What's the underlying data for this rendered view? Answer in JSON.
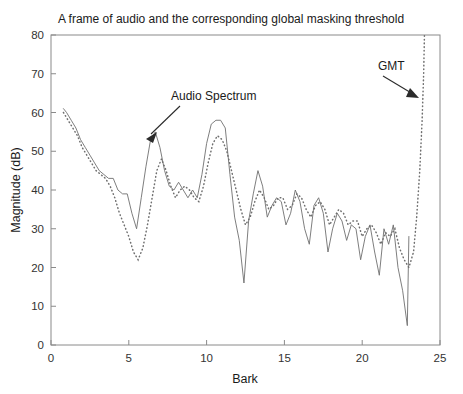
{
  "chart_data": {
    "type": "line",
    "title": "A frame of audio and the corresponding global masking threshold",
    "xlabel": "Bark",
    "ylabel": "Magnitude (dB)",
    "xlim": [
      0,
      25
    ],
    "ylim": [
      0,
      80
    ],
    "xticks": [
      0,
      5,
      10,
      15,
      20,
      25
    ],
    "yticks": [
      0,
      10,
      20,
      30,
      40,
      50,
      60,
      70,
      80
    ],
    "grid": false,
    "legend_position": "none",
    "annotations": [
      {
        "text": "Audio Spectrum",
        "target_series": "Audio Spectrum",
        "arrow_direction": "down-left"
      },
      {
        "text": "GMT",
        "target_series": "GMT",
        "arrow_direction": "down-right"
      }
    ],
    "series": [
      {
        "name": "Audio Spectrum",
        "style": "solid",
        "color": "#6f6f6f",
        "x": [
          0.8,
          1.0,
          1.3,
          1.6,
          1.9,
          2.2,
          2.5,
          2.8,
          3.1,
          3.4,
          3.7,
          4.0,
          4.3,
          4.6,
          4.9,
          5.2,
          5.5,
          5.8,
          6.1,
          6.4,
          6.7,
          7.0,
          7.3,
          7.6,
          7.9,
          8.2,
          8.5,
          8.8,
          9.1,
          9.4,
          9.7,
          10.0,
          10.3,
          10.6,
          10.9,
          11.2,
          11.5,
          11.8,
          12.1,
          12.4,
          12.7,
          13.0,
          13.3,
          13.6,
          13.9,
          14.2,
          14.5,
          14.8,
          15.1,
          15.4,
          15.7,
          16.0,
          16.3,
          16.6,
          16.9,
          17.2,
          17.5,
          17.8,
          18.1,
          18.4,
          18.7,
          19.0,
          19.3,
          19.6,
          19.9,
          20.2,
          20.5,
          20.8,
          21.1,
          21.4,
          21.7,
          22.0,
          22.3,
          22.6,
          22.9,
          23.0
        ],
        "y": [
          61,
          60,
          58,
          56,
          53,
          51,
          49,
          47,
          45,
          44,
          43,
          43,
          40,
          39,
          39,
          34,
          30,
          38,
          46,
          53,
          55,
          51,
          45,
          41,
          40,
          42,
          40,
          38,
          40,
          38,
          44,
          52,
          57,
          58,
          58,
          56,
          44,
          33,
          27,
          16,
          32,
          39,
          45,
          41,
          33,
          36,
          38,
          37,
          31,
          34,
          40,
          37,
          30,
          26,
          36,
          38,
          34,
          24,
          30,
          34,
          32,
          27,
          31,
          30,
          22,
          28,
          31,
          24,
          18,
          30,
          26,
          31,
          20,
          14,
          5,
          28
        ]
      },
      {
        "name": "GMT",
        "style": "dotted",
        "color": "#6f6f6f",
        "x": [
          0.8,
          1.1,
          1.4,
          1.7,
          2.0,
          2.3,
          2.6,
          2.9,
          3.2,
          3.5,
          3.8,
          4.1,
          4.4,
          4.7,
          5.0,
          5.3,
          5.6,
          5.9,
          6.2,
          6.5,
          6.8,
          7.1,
          7.4,
          7.7,
          8.0,
          8.3,
          8.6,
          8.9,
          9.2,
          9.5,
          9.8,
          10.1,
          10.4,
          10.7,
          11.0,
          11.3,
          11.6,
          11.9,
          12.2,
          12.5,
          12.8,
          13.1,
          13.4,
          13.7,
          14.0,
          14.3,
          14.6,
          14.9,
          15.2,
          15.5,
          15.8,
          16.1,
          16.4,
          16.7,
          17.0,
          17.3,
          17.6,
          17.9,
          18.2,
          18.5,
          18.8,
          19.1,
          19.4,
          19.7,
          20.0,
          20.3,
          20.6,
          20.9,
          21.2,
          21.5,
          21.8,
          22.1,
          22.4,
          22.7,
          23.0,
          23.3,
          23.5,
          23.7,
          23.85,
          23.95,
          24.0
        ],
        "y": [
          60,
          58,
          56,
          54,
          51,
          49,
          47,
          45,
          44,
          43,
          41,
          38,
          34,
          31,
          28,
          24,
          22,
          25,
          31,
          38,
          45,
          48,
          45,
          41,
          38,
          40,
          41,
          40,
          38,
          37,
          41,
          47,
          52,
          54,
          53,
          50,
          45,
          40,
          35,
          31,
          33,
          37,
          40,
          38,
          35,
          36,
          38,
          38,
          35,
          36,
          39,
          38,
          35,
          33,
          36,
          37,
          35,
          31,
          33,
          35,
          34,
          31,
          32,
          32,
          28,
          30,
          31,
          29,
          26,
          29,
          28,
          30,
          25,
          22,
          20,
          24,
          33,
          45,
          58,
          70,
          80
        ]
      }
    ]
  },
  "axes": {
    "ylabel": "Magnitude (dB)",
    "xlabel": "Bark"
  },
  "annotations": {
    "audio_spectrum": "Audio Spectrum",
    "gmt": "GMT"
  },
  "colors": {
    "line": "#6f6f6f",
    "axis": "#8a8a8a",
    "text": "#1a1a1a",
    "background": "#ffffff"
  }
}
